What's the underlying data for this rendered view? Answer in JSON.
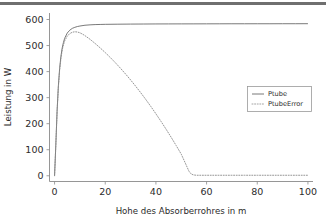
{
  "chart_data": {
    "type": "line",
    "title": "",
    "xlabel": "Hohe des Absorberrohres in m",
    "ylabel": "Leistung in W",
    "xlim": [
      -2,
      102
    ],
    "ylim": [
      -22,
      625
    ],
    "xticks": [
      0,
      20,
      40,
      60,
      80,
      100
    ],
    "yticks": [
      0,
      100,
      200,
      300,
      400,
      500,
      600
    ],
    "grid": false,
    "legend_position": "center-right",
    "series": [
      {
        "name": "Ptube",
        "style": "solid",
        "color": "#6a6a6a",
        "x": [
          0,
          0.5,
          1,
          1.5,
          2,
          2.5,
          3,
          3.5,
          4,
          5,
          6,
          7,
          8,
          9,
          10,
          12,
          14,
          16,
          18,
          20,
          25,
          30,
          35,
          40,
          45,
          50,
          55,
          60,
          65,
          70,
          75,
          80,
          85,
          90,
          95,
          100
        ],
        "y": [
          0,
          120,
          250,
          345,
          412,
          458,
          490,
          512,
          528,
          548,
          559,
          566,
          570,
          573,
          575,
          578,
          579.5,
          580.5,
          581,
          581.5,
          582,
          582.4,
          582.7,
          583,
          583.1,
          583.2,
          583.3,
          583.4,
          583.5,
          583.6,
          583.6,
          583.7,
          583.7,
          583.8,
          583.8,
          583.9
        ]
      },
      {
        "name": "PtubeError",
        "style": "dotted",
        "color": "#8a8a8a",
        "x": [
          0,
          0.5,
          1,
          1.5,
          2,
          2.5,
          3,
          3.5,
          4,
          5,
          6,
          7,
          8,
          9,
          10,
          11,
          12,
          14,
          16,
          18,
          20,
          22,
          24,
          26,
          28,
          30,
          32,
          34,
          36,
          38,
          40,
          42,
          44,
          46,
          48,
          50,
          52,
          53,
          54,
          55,
          56,
          58,
          60,
          65,
          70,
          75,
          80,
          85,
          90,
          95,
          100
        ],
        "y": [
          0,
          118,
          246,
          340,
          406,
          450,
          482,
          503,
          518,
          536,
          546,
          551,
          553,
          552,
          549,
          544,
          538,
          524,
          508,
          491,
          473,
          454,
          434,
          413,
          391,
          368,
          344,
          319,
          293,
          266,
          238,
          209,
          179,
          148,
          116,
          83,
          40,
          18,
          6,
          3,
          2,
          2,
          2,
          2,
          2,
          2,
          2,
          2,
          2,
          2,
          2
        ]
      }
    ]
  },
  "legend": {
    "entries": [
      {
        "label": "Ptube"
      },
      {
        "label": "PtubeError"
      }
    ]
  },
  "axes": {
    "x_tick_labels": [
      "0",
      "20",
      "40",
      "60",
      "80",
      "100"
    ],
    "y_tick_labels": [
      "0",
      "100",
      "200",
      "300",
      "400",
      "500",
      "600"
    ],
    "x_title": "Hohe des Absorberrohres in m",
    "y_title": "Leistung in W"
  },
  "colors": {
    "series_1": "#6a6a6a",
    "series_2": "#8a8a8a",
    "axis": "#8a8a8a",
    "text": "#2b2b2b",
    "topbar": "#6f6f6f"
  }
}
